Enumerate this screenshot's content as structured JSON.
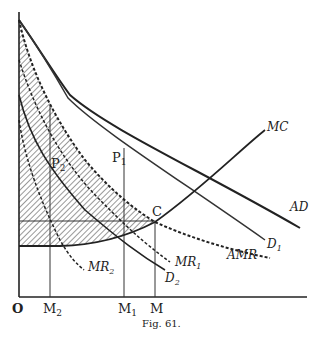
{
  "figure": {
    "caption": "Fig. 61.",
    "axes": {
      "origin_label": "O",
      "x_ticks": [
        {
          "label": "M",
          "sub": "2"
        },
        {
          "label": "M",
          "sub": "1"
        },
        {
          "label": "M",
          "sub": ""
        }
      ]
    },
    "points": [
      {
        "label": "P",
        "sub": "1"
      },
      {
        "label": "P",
        "sub": "2"
      },
      {
        "label": "C",
        "sub": ""
      }
    ],
    "curves": [
      {
        "label": "MC",
        "sub": "",
        "style": "solid"
      },
      {
        "label": "AD",
        "sub": "",
        "style": "solid"
      },
      {
        "label": "D",
        "sub": "1",
        "style": "solid"
      },
      {
        "label": "D",
        "sub": "2",
        "style": "solid"
      },
      {
        "label": "AMR",
        "sub": "",
        "style": "dashed"
      },
      {
        "label": "MR",
        "sub": "1",
        "style": "dashed"
      },
      {
        "label": "MR",
        "sub": "2",
        "style": "dashed"
      }
    ],
    "shaded_region": "hatched area between AMR and MC"
  },
  "colors": {
    "ink": "#222222",
    "background": "#ffffff"
  }
}
